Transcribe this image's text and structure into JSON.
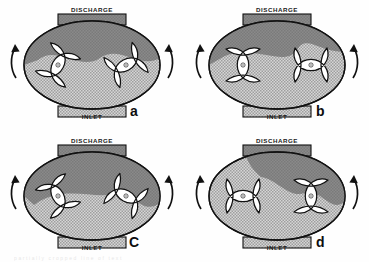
{
  "figure": {
    "type": "lobe-pump-operation-cycle",
    "panel_count": 4,
    "grid": "2x2",
    "background_color": "#ffffff",
    "outline_color": "#111111",
    "discharge_fill_color": "#878787",
    "inlet_fill_color": "#c9c9c9",
    "rotor_fill_color": "#ffffff",
    "bottom_artifact_text": "partially cropped line of text"
  },
  "labels": {
    "discharge": "DISCHARGE",
    "inlet": "INLET"
  },
  "panels": [
    {
      "id": "a",
      "letter": "a",
      "discharge_label": "DISCHARGE",
      "inlet_label": "INLET",
      "left_rotor_angle_deg": 28,
      "right_rotor_angle_deg": 62,
      "left_rotation": "counterclockwise",
      "right_rotation": "clockwise",
      "hub_marker": "o"
    },
    {
      "id": "b",
      "letter": "b",
      "discharge_label": "DISCHARGE",
      "inlet_label": "INLET",
      "left_rotor_angle_deg": 0,
      "right_rotor_angle_deg": 90,
      "left_rotation": "counterclockwise",
      "right_rotation": "clockwise",
      "hub_marker": "o"
    },
    {
      "id": "c",
      "letter": "C",
      "discharge_label": "DISCHARGE",
      "inlet_label": "INLET",
      "left_rotor_angle_deg": -28,
      "right_rotor_angle_deg": 118,
      "left_rotation": "counterclockwise",
      "right_rotation": "clockwise",
      "hub_marker": "o"
    },
    {
      "id": "d",
      "letter": "d",
      "discharge_label": "DISCHARGE",
      "inlet_label": "INLET",
      "left_rotor_angle_deg": 90,
      "right_rotor_angle_deg": 0,
      "left_rotation": "counterclockwise",
      "right_rotation": "clockwise",
      "hub_marker": "o"
    }
  ]
}
